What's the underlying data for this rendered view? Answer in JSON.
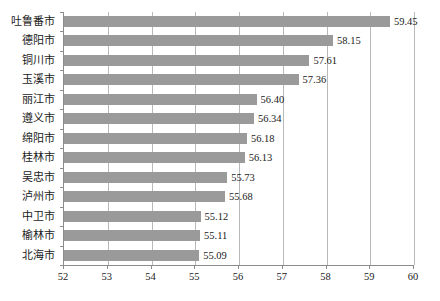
{
  "chart_data": {
    "type": "bar",
    "orientation": "horizontal",
    "title": "",
    "subtitle": "",
    "xlabel": "",
    "ylabel": "",
    "xlim": [
      52,
      60
    ],
    "xticks": [
      52,
      53,
      54,
      55,
      56,
      57,
      58,
      59,
      60
    ],
    "xtick_labels": [
      "52",
      "53",
      "54",
      "55",
      "56",
      "57",
      "58",
      "59",
      "60"
    ],
    "grid": "vertical",
    "legend": null,
    "bar_color": "#9a9a9a",
    "axis_color": "#8c8c8c",
    "gridline_color": "#b9b9b9",
    "categories": [
      "吐鲁番市",
      "德阳市",
      "铜川市",
      "玉溪市",
      "丽江市",
      "遵义市",
      "绵阳市",
      "桂林市",
      "吴忠市",
      "泸州市",
      "中卫市",
      "榆林市",
      "北海市"
    ],
    "values": [
      59.45,
      58.15,
      57.61,
      57.36,
      56.4,
      56.34,
      56.18,
      56.13,
      55.73,
      55.68,
      55.12,
      55.11,
      55.09
    ],
    "value_labels": [
      "59.45",
      "58.15",
      "57.61",
      "57.36",
      "56.40",
      "56.34",
      "56.18",
      "56.13",
      "55.73",
      "55.68",
      "55.12",
      "55.11",
      "55.09"
    ]
  }
}
